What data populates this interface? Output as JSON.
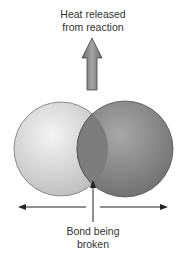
{
  "top_label": {
    "line1": "Heat released",
    "line2": "from reaction"
  },
  "bottom_label": {
    "line1": "Bond being",
    "line2": "broken"
  },
  "colors": {
    "left_atom": "#d9d9d9",
    "right_atom": "#8c8c8c",
    "overlap": "#7a7a7a",
    "arrow": "#222222",
    "heat_arrow": "#8a8a8a"
  }
}
